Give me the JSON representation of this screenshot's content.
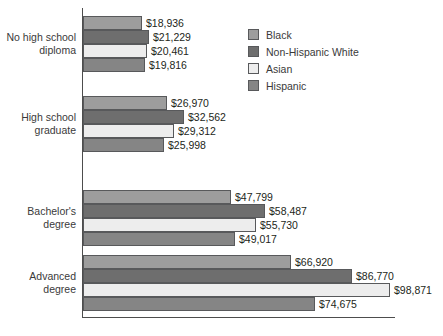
{
  "chart_data": {
    "type": "bar",
    "orientation": "horizontal",
    "title": "",
    "xlabel": "",
    "ylabel": "",
    "grid": false,
    "legend_position": "top-right",
    "value_prefix": "$",
    "xlim": [
      0,
      98871
    ],
    "categories": [
      "No high school\ndiploma",
      "High school\ngraduate",
      "Bachelor's\ndegree",
      "Advanced\ndegree"
    ],
    "series": [
      {
        "name": "Black",
        "color": "#9d9d9d",
        "values": [
          18936,
          26970,
          47799,
          66920
        ],
        "labels": [
          "$18,936",
          "$26,970",
          "$47,799",
          "$66,920"
        ]
      },
      {
        "name": "Non-Hispanic White",
        "color": "#6e6e6e",
        "values": [
          21229,
          32562,
          58487,
          86770
        ],
        "labels": [
          "$21,229",
          "$32,562",
          "$58,487",
          "$86,770"
        ]
      },
      {
        "name": "Asian",
        "color": "#ededed",
        "values": [
          20461,
          29312,
          55730,
          98871
        ],
        "labels": [
          "$20,461",
          "$29,312",
          "$55,730",
          "$98,871"
        ]
      },
      {
        "name": "Hispanic",
        "color": "#858585",
        "values": [
          19816,
          25998,
          49017,
          74675
        ],
        "labels": [
          "$19,816",
          "$25,998",
          "$49,017",
          "$74,675"
        ]
      }
    ]
  },
  "axes": {
    "y_axis_color": "#4d4d4d",
    "x_axis_color": "#4d4d4d"
  },
  "legend": {
    "entries": [
      {
        "label": "Black",
        "color": "#9d9d9d"
      },
      {
        "label": "Non-Hispanic White",
        "color": "#6e6e6e"
      },
      {
        "label": "Asian",
        "color": "#ededed"
      },
      {
        "label": "Hispanic",
        "color": "#858585"
      }
    ]
  }
}
